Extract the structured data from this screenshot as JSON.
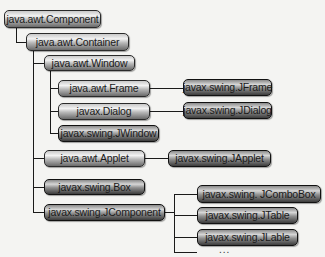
{
  "diagram": {
    "type": "class-hierarchy-tree",
    "nodes": {
      "component": "java.awt.Component",
      "container": "java.awt.Container",
      "window": "java.awt.Window",
      "frame": "java.awt.Frame",
      "dialog": "javax.Dialog",
      "jwindow": "javax.swing.JWindow",
      "applet": "java.awt.Applet",
      "box": "javax.swing.Box",
      "jcomponent": "javax.swing.JComponent",
      "jframe": "javax.swing.JFrame",
      "jdialog": "javax.swing.JDialog",
      "japplet": "javax.swing.JApplet",
      "jcombobox": "javax.swing. JComboBox",
      "jtable": "javax.swing.JTable",
      "jlable": "javax.swing.JLable",
      "more": "..."
    },
    "edges": [
      [
        "java.awt.Component",
        "java.awt.Container"
      ],
      [
        "java.awt.Container",
        "java.awt.Window"
      ],
      [
        "java.awt.Container",
        "java.awt.Applet"
      ],
      [
        "java.awt.Container",
        "javax.swing.Box"
      ],
      [
        "java.awt.Container",
        "javax.swing.JComponent"
      ],
      [
        "java.awt.Window",
        "java.awt.Frame"
      ],
      [
        "java.awt.Window",
        "javax.Dialog"
      ],
      [
        "java.awt.Window",
        "javax.swing.JWindow"
      ],
      [
        "java.awt.Frame",
        "javax.swing.JFrame"
      ],
      [
        "javax.Dialog",
        "javax.swing.JDialog"
      ],
      [
        "java.awt.Applet",
        "javax.swing.JApplet"
      ],
      [
        "javax.swing.JComponent",
        "javax.swing. JComboBox"
      ],
      [
        "javax.swing.JComponent",
        "javax.swing.JTable"
      ],
      [
        "javax.swing.JComponent",
        "javax.swing.JLable"
      ],
      [
        "javax.swing.JComponent",
        "..."
      ]
    ]
  }
}
